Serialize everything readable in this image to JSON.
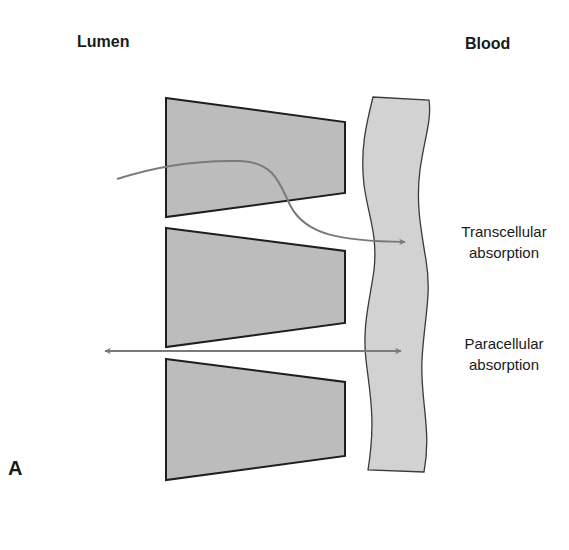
{
  "headers": {
    "lumen": "Lumen",
    "blood": "Blood"
  },
  "panel_label": "A",
  "pathways": [
    {
      "line1": "Transcellular",
      "line2": "absorption"
    },
    {
      "line1": "Paracellular",
      "line2": "absorption"
    }
  ],
  "colors": {
    "cell_fill": "#bcbcbc",
    "cell_stroke": "#1e1e1e",
    "vessel_fill": "#d2d2d2",
    "vessel_stroke": "#3a3a3a",
    "arrow": "#7a7a7a"
  }
}
